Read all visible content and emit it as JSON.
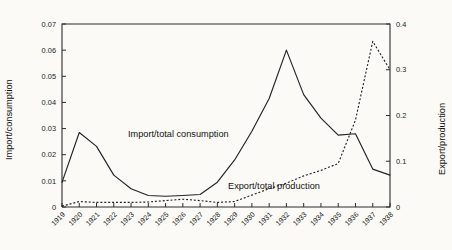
{
  "chart_data": {
    "type": "line",
    "title": "",
    "xlabel": "",
    "ylabel": "Import/consumption",
    "y2label": "Export/production",
    "grid": false,
    "legend_position": "inline-annotations",
    "categories": [
      "1919",
      "1920",
      "1921",
      "1922",
      "1923",
      "1924",
      "1925",
      "1926",
      "1927",
      "1928",
      "1929",
      "1930",
      "1931",
      "1932",
      "1933",
      "1934",
      "1935",
      "1936",
      "1937",
      "1938"
    ],
    "ylim": [
      0,
      0.07
    ],
    "yticks": [
      "0",
      "0.01",
      "0.02",
      "0.03",
      "0.04",
      "0.05",
      "0.06",
      "0.07"
    ],
    "ytickvalues": [
      0,
      0.01,
      0.02,
      0.03,
      0.04,
      0.05,
      0.06,
      0.07
    ],
    "y2lim": [
      0,
      0.4
    ],
    "y2ticks": [
      "0",
      "0.1",
      "0.2",
      "0.3",
      "0.4"
    ],
    "y2tickvalues": [
      0,
      0.1,
      0.2,
      0.3,
      0.4
    ],
    "series": [
      {
        "name": "Import/total consumption",
        "axis": "left",
        "style": "solid",
        "label_text": "Import/total consumption",
        "values": [
          0.0094,
          0.0285,
          0.0232,
          0.0122,
          0.007,
          0.0044,
          0.0041,
          0.0044,
          0.0048,
          0.0095,
          0.018,
          0.029,
          0.0415,
          0.06,
          0.043,
          0.034,
          0.0275,
          0.028,
          0.0145,
          0.0122
        ]
      },
      {
        "name": "Export/total production",
        "axis": "right",
        "style": "dotted",
        "label_text": "Export/total production",
        "values": [
          0.002,
          0.012,
          0.01,
          0.01,
          0.01,
          0.011,
          0.014,
          0.017,
          0.014,
          0.01,
          0.012,
          0.026,
          0.04,
          0.052,
          0.068,
          0.08,
          0.095,
          0.19,
          0.362,
          0.3
        ]
      }
    ],
    "colors": {
      "line": "#232323",
      "axis": "#2b2b2b",
      "background": "#fbfaf7"
    }
  }
}
